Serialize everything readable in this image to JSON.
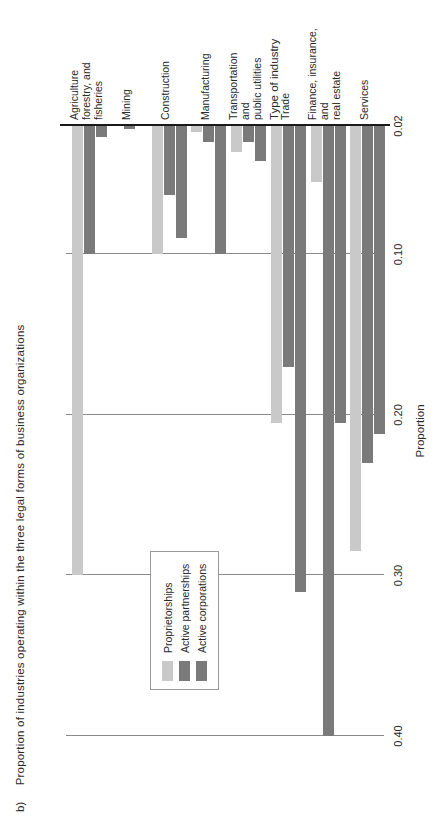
{
  "figure": {
    "panel_letter": "b)",
    "title": "Proportion of industries operating within the three legal forms of business organizations"
  },
  "chart_data": {
    "type": "bar",
    "orientation": "horizontal",
    "xlabel": "Type of industry",
    "ylabel": "Proportion",
    "grid": true,
    "legend_position": "upper-left-inside",
    "axis_ticks": [
      "0.40",
      "0.30",
      "0.20",
      "0.10",
      "0.02"
    ],
    "axis_tick_values": [
      0.4,
      0.3,
      0.2,
      0.1,
      0.02
    ],
    "ylim": [
      0.02,
      0.4
    ],
    "categories": [
      "Agriculture\nforestry, and\nfisheries",
      "Mining",
      "Construction",
      "Manufacturing",
      "Transportation\nand\npublic utilities",
      "Trade",
      "Finance, insurance,\nand\nreal estate",
      "Services"
    ],
    "category_labels": [
      "Agriculture forestry, and fisheries",
      "Mining",
      "Construction",
      "Manufacturing",
      "Transportation and public utilities",
      "Trade",
      "Finance, insurance, and real estate",
      "Services"
    ],
    "series": [
      {
        "name": "Proprietorships",
        "color": "#c9c9c9",
        "values": [
          0.3,
          0.01,
          0.1,
          0.024,
          0.036,
          0.205,
          0.055,
          0.285
        ]
      },
      {
        "name": "Active partnerships",
        "color": "#7a7a7a",
        "values": [
          0.1,
          0.022,
          0.063,
          0.03,
          0.03,
          0.17,
          0.4,
          0.23
        ]
      },
      {
        "name": "Active corporations",
        "color": "#7a7a7a",
        "values": [
          0.027,
          0.017,
          0.09,
          0.1,
          0.042,
          0.31,
          0.205,
          0.212
        ]
      }
    ],
    "legend": [
      "Proprietorships",
      "Active partnerships",
      "Active corporations"
    ]
  }
}
